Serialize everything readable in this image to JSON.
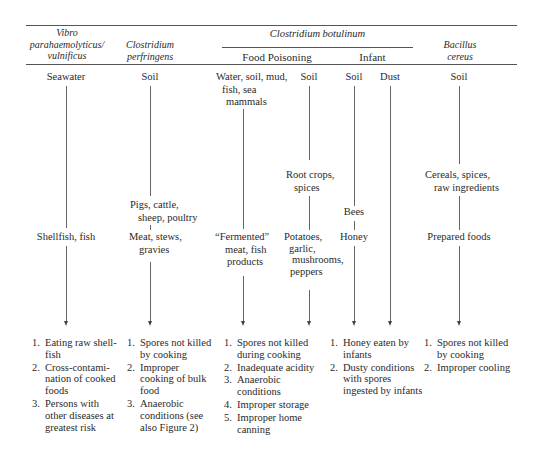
{
  "header": {
    "vibrio": [
      "Vibro",
      "parahaemolyticus/",
      "vulnificus"
    ],
    "perfringens": [
      "Clostridium",
      "perfringens"
    ],
    "botulinum": "Clostridium botulinum",
    "food_poisoning": "Food Poisoning",
    "infant": "Infant",
    "bacillus": [
      "Bacillus",
      "cereus"
    ]
  },
  "sources": {
    "vibrio": "Seawater",
    "perfringens": "Soil",
    "fp_water": [
      "Water, soil, mud,",
      "fish, sea",
      "mammals"
    ],
    "fp_soil": "Soil",
    "infant_soil": "Soil",
    "infant_dust": "Dust",
    "bacillus": "Soil"
  },
  "intermediates": {
    "perfringens": [
      "Pigs, cattle,",
      "sheep, poultry"
    ],
    "fp_soil": [
      "Root crops,",
      "spices"
    ],
    "infant_soil": "Bees",
    "bacillus": [
      "Cereals, spices,",
      "raw ingredients"
    ]
  },
  "foods": {
    "vibrio": "Shellfish, fish",
    "perfringens": [
      "Meat, stews,",
      "gravies"
    ],
    "fp_water": [
      "“Fermented”",
      "meat, fish",
      "products"
    ],
    "fp_soil": [
      "Potatoes,",
      "garlic,",
      "mushrooms,",
      "peppers"
    ],
    "infant_soil": "Honey",
    "bacillus": "Prepared foods"
  },
  "factors": {
    "vibrio": [
      {
        "n": "1.",
        "lines": [
          "Eating raw shell-",
          "fish"
        ]
      },
      {
        "n": "2.",
        "lines": [
          "Cross-contami-",
          "nation of cooked",
          "foods"
        ]
      },
      {
        "n": "3.",
        "lines": [
          "Persons with",
          "other diseases at",
          "greatest risk"
        ]
      }
    ],
    "perfringens": [
      {
        "n": "1.",
        "lines": [
          "Spores not killed",
          "by cooking"
        ]
      },
      {
        "n": "2.",
        "lines": [
          "Improper",
          "cooking of bulk",
          "food"
        ]
      },
      {
        "n": "3.",
        "lines": [
          "Anaerobic",
          "conditions (see",
          "also Figure 2)"
        ]
      }
    ],
    "food_poisoning": [
      {
        "n": "1.",
        "lines": [
          "Spores not killed",
          "during cooking"
        ]
      },
      {
        "n": "2.",
        "lines": [
          "Inadequate acidity"
        ]
      },
      {
        "n": "3.",
        "lines": [
          "Anaerobic",
          "conditions"
        ]
      },
      {
        "n": "4.",
        "lines": [
          "Improper storage"
        ]
      },
      {
        "n": "5.",
        "lines": [
          "Improper home",
          "canning"
        ]
      }
    ],
    "infant": [
      {
        "n": "1.",
        "lines": [
          "Honey eaten by",
          "infants"
        ]
      },
      {
        "n": "2.",
        "lines": [
          "Dusty conditions",
          "with spores",
          "ingested by infants"
        ]
      }
    ],
    "bacillus": [
      {
        "n": "1.",
        "lines": [
          "Spores not killed",
          "by cooking"
        ]
      },
      {
        "n": "2.",
        "lines": [
          "Improper cooling"
        ]
      }
    ]
  }
}
